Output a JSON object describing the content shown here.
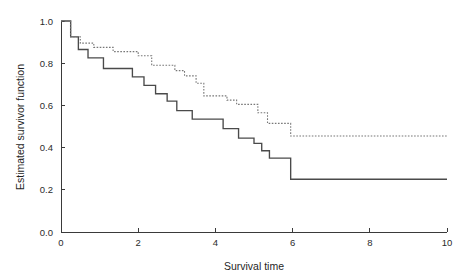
{
  "figure": {
    "background_color": "#ffffff",
    "solid_curve_color": "#4a4a4a",
    "dashed_curve_color": "#777777",
    "axis_color": "#3a3a3a"
  },
  "axes": {
    "x_title": "Survival time",
    "y_title": "Estimated survivor function",
    "x_ticks": [
      "0",
      "2",
      "4",
      "6",
      "8",
      "10"
    ],
    "y_ticks": [
      "0.0",
      "0.2",
      "0.4",
      "0.6",
      "0.8",
      "1.0"
    ]
  },
  "chart_data": {
    "type": "line",
    "title": "",
    "subtitle": "",
    "xlabel": "Survival time",
    "ylabel": "Estimated survivor function",
    "xlim": [
      0,
      10
    ],
    "ylim": [
      0.0,
      1.0
    ],
    "x_ticks": [
      0,
      2,
      4,
      6,
      8,
      10
    ],
    "y_ticks": [
      0.0,
      0.2,
      0.4,
      0.6,
      0.8,
      1.0
    ],
    "grid": false,
    "legend": null,
    "legend_position": "none",
    "step_style": "post",
    "annotations": [],
    "series": [
      {
        "name": "Group 1 (solid line)",
        "style": "solid",
        "color": "#4a4a4a",
        "final_plateau": 0.25,
        "x": [
          0.0,
          0.25,
          0.25,
          0.45,
          0.45,
          0.7,
          0.7,
          1.1,
          1.1,
          1.85,
          1.85,
          2.15,
          2.15,
          2.45,
          2.45,
          2.75,
          2.75,
          3.0,
          3.0,
          3.4,
          3.4,
          4.2,
          4.2,
          4.6,
          4.6,
          5.0,
          5.0,
          5.2,
          5.2,
          5.4,
          5.4,
          5.95,
          5.95,
          10.0
        ],
        "y": [
          1.0,
          1.0,
          0.925,
          0.925,
          0.865,
          0.865,
          0.825,
          0.825,
          0.775,
          0.775,
          0.735,
          0.735,
          0.695,
          0.695,
          0.655,
          0.655,
          0.62,
          0.62,
          0.575,
          0.575,
          0.535,
          0.535,
          0.49,
          0.49,
          0.445,
          0.445,
          0.42,
          0.42,
          0.385,
          0.385,
          0.35,
          0.35,
          0.25,
          0.25
        ]
      },
      {
        "name": "Group 2 (dashed line)",
        "style": "dashed",
        "color": "#777777",
        "final_plateau": 0.455,
        "x": [
          0.0,
          0.25,
          0.25,
          0.5,
          0.5,
          0.85,
          0.85,
          1.35,
          1.35,
          2.0,
          2.0,
          2.35,
          2.35,
          2.95,
          2.95,
          3.2,
          3.2,
          3.5,
          3.5,
          3.7,
          3.7,
          4.3,
          4.3,
          4.55,
          4.55,
          5.1,
          5.1,
          5.35,
          5.35,
          5.95,
          5.95,
          10.0
        ],
        "y": [
          1.0,
          1.0,
          0.925,
          0.925,
          0.895,
          0.895,
          0.875,
          0.875,
          0.855,
          0.855,
          0.835,
          0.835,
          0.79,
          0.79,
          0.765,
          0.765,
          0.74,
          0.74,
          0.705,
          0.705,
          0.645,
          0.645,
          0.625,
          0.625,
          0.605,
          0.605,
          0.565,
          0.565,
          0.515,
          0.515,
          0.455,
          0.455
        ]
      }
    ]
  }
}
